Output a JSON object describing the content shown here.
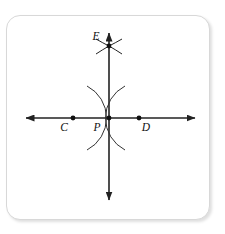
{
  "figure": {
    "type": "geometry-construction",
    "background_color": "#ffffff",
    "frame": {
      "border_color": "#d8d8d8",
      "corner_radius": 14,
      "x": 6,
      "y": 15,
      "width": 204,
      "height": 205
    },
    "style": {
      "line_color": "#222222",
      "arc_color": "#333333",
      "point_color": "#111111",
      "label_color": "#111111"
    },
    "points": [
      {
        "id": "C",
        "label": "C",
        "x": 73,
        "y": 118,
        "label_x": 64,
        "label_y": 131
      },
      {
        "id": "P",
        "label": "P",
        "x": 109,
        "y": 118,
        "label_x": 97,
        "label_y": 131
      },
      {
        "id": "D",
        "label": "D",
        "x": 139,
        "y": 118,
        "label_x": 143,
        "label_y": 131
      },
      {
        "id": "E",
        "label": "E",
        "x": 109,
        "y": 46,
        "label_x": 93,
        "label_y": 40
      }
    ],
    "lines": [
      {
        "id": "horizontal-line",
        "x1": 26,
        "y1": 118,
        "x2": 195,
        "y2": 118,
        "arrows": "both"
      },
      {
        "id": "vertical-line",
        "x1": 109,
        "y1": 33,
        "x2": 109,
        "y2": 200,
        "arrows": "both"
      }
    ],
    "arcs": [
      {
        "id": "arc-centered-at-C",
        "center": "C",
        "cx": 73,
        "cy": 118,
        "radius": 36,
        "opens": "left"
      },
      {
        "id": "arc-centered-at-D",
        "center": "D",
        "cx": 139,
        "cy": 118,
        "radius": 36,
        "opens": "right"
      }
    ],
    "intersection_marks": {
      "id": "construction-cross-at-E",
      "at_point": "E",
      "stroke_count": 4
    }
  }
}
